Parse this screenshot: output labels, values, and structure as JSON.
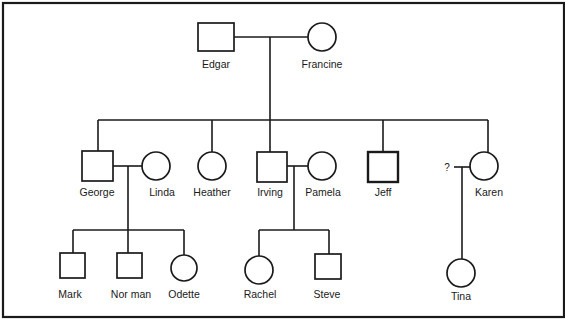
{
  "diagram": {
    "type": "pedigree-chart",
    "frame": {
      "x": 3,
      "y": 3,
      "width": 561,
      "height": 314
    },
    "legend_conventions": {
      "square": "male",
      "circle": "female"
    },
    "people": [
      {
        "id": "edgar",
        "name": "Edgar",
        "sex": "male",
        "generation": 1,
        "shape": {
          "x": 198,
          "y": 23,
          "w": 36,
          "h": 28
        },
        "label_pos": [
          216,
          68
        ]
      },
      {
        "id": "francine",
        "name": "Francine",
        "sex": "female",
        "generation": 1,
        "shape": {
          "cx": 322,
          "cy": 37,
          "r": 14
        },
        "label_pos": [
          322,
          68
        ]
      },
      {
        "id": "george",
        "name": "George",
        "sex": "male",
        "generation": 2,
        "shape": {
          "x": 82,
          "y": 151,
          "w": 31,
          "h": 30
        },
        "label_pos": [
          97,
          196
        ]
      },
      {
        "id": "linda",
        "name": "Linda",
        "sex": "female",
        "generation": 2,
        "shape": {
          "cx": 156,
          "cy": 166,
          "r": 14
        },
        "label_pos": [
          162,
          196
        ]
      },
      {
        "id": "heather",
        "name": "Heather",
        "sex": "female",
        "generation": 2,
        "shape": {
          "cx": 212,
          "cy": 166,
          "r": 14
        },
        "label_pos": [
          212,
          196
        ]
      },
      {
        "id": "irving",
        "name": "Irving",
        "sex": "male",
        "generation": 2,
        "shape": {
          "x": 257,
          "y": 152,
          "w": 30,
          "h": 30
        },
        "label_pos": [
          270,
          196
        ]
      },
      {
        "id": "pamela",
        "name": "Pamela",
        "sex": "female",
        "generation": 2,
        "shape": {
          "cx": 322,
          "cy": 166,
          "r": 14
        },
        "label_pos": [
          323,
          196
        ]
      },
      {
        "id": "jeff",
        "name": "Jeff",
        "sex": "male",
        "generation": 2,
        "shape": {
          "x": 368,
          "y": 152,
          "w": 30,
          "h": 30
        },
        "label_pos": [
          383,
          196
        ],
        "bold": true
      },
      {
        "id": "karen",
        "name": "Karen",
        "sex": "female",
        "generation": 2,
        "shape": {
          "cx": 484,
          "cy": 166,
          "r": 14
        },
        "label_pos": [
          489,
          196
        ]
      },
      {
        "id": "mark",
        "name": "Mark",
        "sex": "male",
        "generation": 3,
        "shape": {
          "x": 60,
          "y": 253,
          "w": 25,
          "h": 25
        },
        "label_pos": [
          70,
          298
        ]
      },
      {
        "id": "norman",
        "name": "Nor man",
        "sex": "male",
        "generation": 3,
        "shape": {
          "x": 117,
          "y": 253,
          "w": 25,
          "h": 25
        },
        "label_pos": [
          131,
          298
        ]
      },
      {
        "id": "odette",
        "name": "Odette",
        "sex": "female",
        "generation": 3,
        "shape": {
          "cx": 184,
          "cy": 268,
          "r": 13
        },
        "label_pos": [
          184,
          298
        ]
      },
      {
        "id": "rachel",
        "name": "Rachel",
        "sex": "female",
        "generation": 3,
        "shape": {
          "cx": 259,
          "cy": 270,
          "r": 14
        },
        "label_pos": [
          260,
          298
        ]
      },
      {
        "id": "steve",
        "name": "Steve",
        "sex": "male",
        "generation": 3,
        "shape": {
          "x": 315,
          "y": 254,
          "w": 26,
          "h": 25
        },
        "label_pos": [
          327,
          298
        ]
      },
      {
        "id": "tina",
        "name": "Tina",
        "sex": "female",
        "generation": 3,
        "shape": {
          "cx": 461,
          "cy": 273,
          "r": 14
        },
        "label_pos": [
          461,
          300
        ]
      }
    ],
    "unknown_partner": {
      "label": "?",
      "pos": [
        447,
        171
      ],
      "partner_of": "karen"
    },
    "marriages": [
      {
        "partners": [
          "edgar",
          "francine"
        ],
        "line": [
          [
            234,
            37
          ],
          [
            308,
            37
          ]
        ]
      },
      {
        "partners": [
          "george",
          "linda"
        ],
        "line": [
          [
            113,
            166
          ],
          [
            142,
            166
          ]
        ]
      },
      {
        "partners": [
          "irving",
          "pamela"
        ],
        "line": [
          [
            287,
            166
          ],
          [
            308,
            166
          ]
        ]
      },
      {
        "partners": [
          "unknown",
          "karen"
        ],
        "line": [
          [
            454,
            167
          ],
          [
            470,
            167
          ]
        ]
      }
    ],
    "descent_lines": [
      [
        [
          270,
          37
        ],
        [
          270,
          120
        ]
      ],
      [
        [
          128,
          166
        ],
        [
          128,
          230
        ]
      ],
      [
        [
          294,
          166
        ],
        [
          294,
          230
        ]
      ],
      [
        [
          462,
          167
        ],
        [
          462,
          259
        ]
      ]
    ],
    "sibling_lines": [
      {
        "parents": [
          "edgar",
          "francine"
        ],
        "bar": [
          [
            98,
            120
          ],
          [
            488,
            120
          ]
        ],
        "drops": [
          [
            98,
            151
          ],
          [
            212,
            152
          ],
          [
            270,
            152
          ],
          [
            383,
            152
          ],
          [
            488,
            152
          ]
        ]
      },
      {
        "parents": [
          "george",
          "linda"
        ],
        "bar": [
          [
            73,
            230
          ],
          [
            184,
            230
          ]
        ],
        "drops": [
          [
            73,
            253
          ],
          [
            128,
            253
          ],
          [
            184,
            255
          ]
        ]
      },
      {
        "parents": [
          "irving",
          "pamela"
        ],
        "bar": [
          [
            259,
            230
          ],
          [
            329,
            230
          ]
        ],
        "drops": [
          [
            259,
            256
          ],
          [
            329,
            254
          ]
        ]
      }
    ]
  }
}
